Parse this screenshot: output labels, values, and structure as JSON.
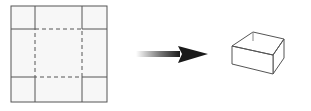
{
  "diagram": {
    "net": {
      "outer": {
        "x": 11,
        "y": 6,
        "w": 96,
        "h": 96
      },
      "cut_lines_x": [
        35,
        82
      ],
      "cut_lines_y": [
        29,
        77
      ],
      "fold_square": {
        "x": 35,
        "y": 29,
        "w": 47,
        "h": 48
      },
      "line_color": "#555555",
      "fill_color": "#f7f7f7"
    },
    "arrow": {
      "x1": 136,
      "x2": 208,
      "y": 54,
      "color": "#222222"
    },
    "box": {
      "front_top_left": [
        232,
        46
      ],
      "front_top_right": [
        273,
        55
      ],
      "back_top_left": [
        253,
        32
      ],
      "back_top_right": [
        284,
        39
      ],
      "front_bottom_left": [
        232,
        64
      ],
      "front_bottom_right": [
        273,
        74
      ],
      "back_bottom_right": [
        284,
        58
      ],
      "line_color": "#555555"
    }
  }
}
